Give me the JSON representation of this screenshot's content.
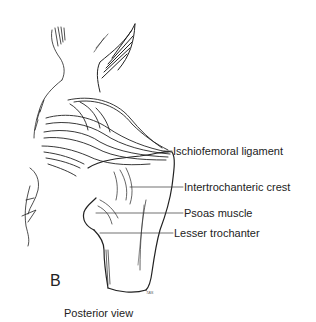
{
  "figure": {
    "panel_letter": "B",
    "caption": "Posterior view",
    "signature": "TAS",
    "labels": [
      {
        "text": "Ischiofemoral ligament"
      },
      {
        "text": "Intertrochanteric crest"
      },
      {
        "text": "Psoas muscle"
      },
      {
        "text": "Lesser trochanter"
      }
    ]
  }
}
